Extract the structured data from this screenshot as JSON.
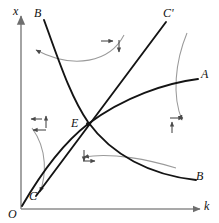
{
  "figure": {
    "type": "phase-diagram",
    "background": "#ffffff",
    "curve_color": "#1a1a1a",
    "arrow_color": "#8a8a8a",
    "axis_color": "#6e6e6e"
  },
  "axes": {
    "y_label": "x",
    "x_label": "k",
    "origin_label": "O"
  },
  "labels": {
    "b_top": "B",
    "b_bottom": "B",
    "c_prime": "C'",
    "c_bottom": "C",
    "a_right": "A",
    "equilibrium": "E"
  },
  "curves": [
    {
      "name": "BB-locus",
      "endpoints": [
        "B",
        "B"
      ],
      "shape": "decreasing-convex",
      "path": "M 44 20 C 58 58, 70 96, 88 122 C 112 155, 150 175, 196 180"
    },
    {
      "name": "AA-locus",
      "endpoints": [
        "O",
        "A"
      ],
      "shape": "increasing-concave",
      "path": "M 22 206 C 40 175, 62 144, 88 124 C 124 97, 166 83, 198 79"
    },
    {
      "name": "CC-saddle-path",
      "endpoints": [
        "C",
        "C'"
      ],
      "shape": "straight-line",
      "path": "M 36 196 L 166 22"
    }
  ],
  "equilibrium_point": {
    "label": "E",
    "x": 88,
    "y": 124
  },
  "dynamic_arrows": [
    {
      "region": "upper-left",
      "directions": [
        "left"
      ],
      "note": "arrow head pointing left on gray arc"
    },
    {
      "region": "upper-mid",
      "directions": [
        "right",
        "down"
      ],
      "note": "pair of arrowheads above E"
    },
    {
      "region": "left-of-E",
      "directions": [
        "left",
        "up"
      ],
      "note": "pair of arrowheads left of E"
    },
    {
      "region": "below-E",
      "directions": [
        "down",
        "right"
      ],
      "note": "pair of arrowheads below E"
    },
    {
      "region": "right-of-E",
      "directions": [
        "right",
        "up"
      ],
      "note": "pair of arrowheads right of E"
    },
    {
      "region": "lower-left",
      "directions": [
        "down"
      ],
      "note": "gray arc descending toward C"
    },
    {
      "region": "lower-mid",
      "directions": [
        "left"
      ],
      "note": "gray arc sweeping left below E"
    }
  ]
}
